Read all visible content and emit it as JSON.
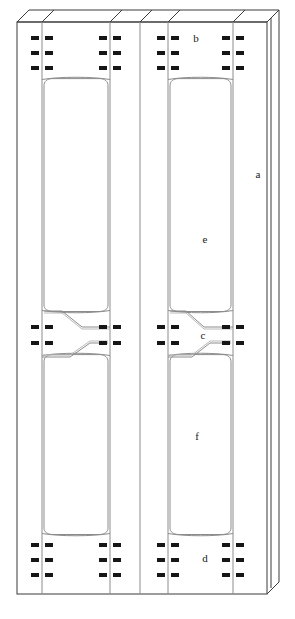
{
  "diagram": {
    "type": "technical-line-drawing",
    "canvas": {
      "width": 295,
      "height": 619
    },
    "projection": {
      "kind": "oblique",
      "depth_dx": 12,
      "depth_dy": -12
    },
    "style": {
      "line_color": "#3a3a3a",
      "line_color_light": "#9a9a9a",
      "mark_color": "#161616",
      "background": "#ffffff",
      "stroke_width": 1
    },
    "frame": {
      "front_face": {
        "x": 17,
        "y": 22,
        "width": 250,
        "height": 572
      },
      "outer_right_edge_x": 271
    },
    "labels": [
      {
        "id": "a",
        "text": "a",
        "x": 258,
        "y": 175,
        "refers_to": "outer-frame-side-rail"
      },
      {
        "id": "b",
        "text": "b",
        "x": 196,
        "y": 39,
        "refers_to": "upper-connector-band"
      },
      {
        "id": "c",
        "text": "c",
        "x": 203,
        "y": 336,
        "refers_to": "mid-neck-transition"
      },
      {
        "id": "d",
        "text": "d",
        "x": 205,
        "y": 559,
        "refers_to": "lower-connector-band"
      },
      {
        "id": "e",
        "text": "e",
        "x": 205,
        "y": 240,
        "refers_to": "upper-panel"
      },
      {
        "id": "f",
        "text": "f",
        "x": 197,
        "y": 437,
        "refers_to": "lower-panel"
      }
    ],
    "vertical_rails": {
      "description": "Front-face vertical division lines (x positions)",
      "x_positions": [
        17,
        42,
        110,
        140,
        168,
        233,
        267,
        271
      ]
    },
    "bays": [
      {
        "name": "left-bay",
        "rail_left_x": 42,
        "rail_right_x": 110,
        "panel_left_x": 41,
        "panel_right_x": 111,
        "upper_panel": {
          "x": 41,
          "y": 80,
          "width": 70,
          "height": 232
        },
        "lower_panel": {
          "x": 41,
          "y": 355,
          "width": 70,
          "height": 180
        }
      },
      {
        "name": "right-bay",
        "rail_left_x": 168,
        "rail_right_x": 233,
        "panel_left_x": 166,
        "panel_right_x": 234,
        "upper_panel": {
          "x": 166,
          "y": 80,
          "width": 68,
          "height": 232
        },
        "lower_panel": {
          "x": 166,
          "y": 355,
          "width": 68,
          "height": 180
        }
      }
    ],
    "connector_bands": [
      {
        "name": "upper-band",
        "row_y": [
          38,
          53,
          68
        ],
        "rail_x": [
          42,
          110,
          168,
          233
        ],
        "rows": 3
      },
      {
        "name": "mid-band-upper",
        "row_y": [
          327,
          343
        ],
        "rail_x": [
          42,
          110,
          168,
          233
        ],
        "rows": 2
      },
      {
        "name": "lower-band",
        "row_y": [
          545,
          560,
          575
        ],
        "rail_x": [
          42,
          110,
          168,
          233
        ],
        "rows": 3
      }
    ],
    "connector_mark": {
      "shape": "paired-rectangles",
      "width": 8,
      "height": 4,
      "gap": 2,
      "description": "Two small filled rectangles straddling a vertical rail line"
    },
    "neck_transitions": [
      {
        "name": "left-neck-upper",
        "y": 313,
        "direction": "down-right"
      },
      {
        "name": "left-neck-lower",
        "y": 352,
        "direction": "up-right"
      },
      {
        "name": "right-neck-upper",
        "y": 313,
        "direction": "down-right"
      },
      {
        "name": "right-neck-lower",
        "y": 352,
        "direction": "up-right"
      }
    ]
  }
}
